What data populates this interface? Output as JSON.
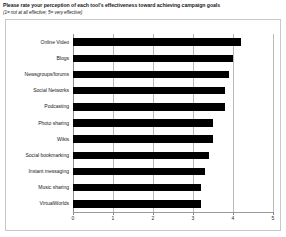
{
  "header": {
    "title": "Please rate your perception of each tool's effectiveness toward achieving campaign goals",
    "subtitle": "(1= not at all effective; 5= very effective)"
  },
  "chart_data": {
    "type": "bar",
    "orientation": "horizontal",
    "title": "Please rate your perception of each tool's effectiveness toward achieving campaign goals",
    "subtitle": "(1= not at all effective; 5= very effective)",
    "xlabel": "",
    "ylabel": "",
    "xlim": [
      0,
      5
    ],
    "xticks": [
      "0",
      "1",
      "2",
      "3",
      "4",
      "5"
    ],
    "grid": true,
    "legend": false,
    "bar_color": "#000000",
    "categories": [
      "Online Video",
      "Blogs",
      "Newsgroups/forums",
      "Social Networks",
      "Podcasting",
      "Photo sharing",
      "Wikis",
      "Social bookmarking",
      "Instant messaging",
      "Music sharing",
      "VirtualWorlds"
    ],
    "values": [
      4.2,
      4.0,
      3.9,
      3.8,
      3.8,
      3.5,
      3.5,
      3.4,
      3.3,
      3.2,
      3.2
    ]
  }
}
